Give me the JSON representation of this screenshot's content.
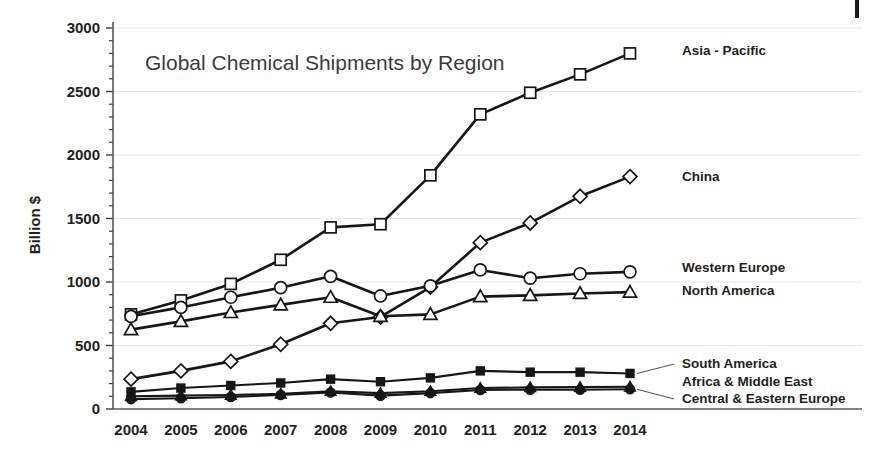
{
  "chart_data": {
    "type": "line",
    "title": "Global Chemical Shipments by Region",
    "xlabel": "",
    "ylabel": "Billion $",
    "ylim": [
      0,
      3000
    ],
    "yticks": [
      0,
      500,
      1000,
      1500,
      2000,
      2500,
      3000
    ],
    "ytick_labels": [
      "0",
      "500",
      "1000",
      "1500",
      "2000",
      "2500",
      "3000"
    ],
    "minor_tick_interval": 100,
    "grid": true,
    "grid_axis": "y",
    "legend_position": "right-inline-labels",
    "categories": [
      "2004",
      "2005",
      "2006",
      "2007",
      "2008",
      "2009",
      "2010",
      "2011",
      "2012",
      "2013",
      "2014"
    ],
    "x": [
      2004,
      2005,
      2006,
      2007,
      2008,
      2009,
      2010,
      2011,
      2012,
      2013,
      2014
    ],
    "series": [
      {
        "name": "Asia - Pacific",
        "marker": "open-square",
        "values": [
          745,
          855,
          985,
          1175,
          1430,
          1455,
          1840,
          2320,
          2490,
          2635,
          2800
        ]
      },
      {
        "name": "China",
        "marker": "open-diamond",
        "values": [
          235,
          300,
          375,
          510,
          675,
          725,
          960,
          1310,
          1465,
          1675,
          1830
        ]
      },
      {
        "name": "Western Europe",
        "marker": "open-circle",
        "values": [
          730,
          800,
          880,
          955,
          1045,
          890,
          970,
          1095,
          1030,
          1065,
          1080
        ]
      },
      {
        "name": "North America",
        "marker": "open-triangle",
        "values": [
          625,
          690,
          760,
          820,
          880,
          730,
          745,
          885,
          895,
          910,
          920
        ]
      },
      {
        "name": "South America",
        "marker": "filled-square",
        "values": [
          135,
          165,
          185,
          205,
          235,
          215,
          245,
          300,
          290,
          290,
          280
        ]
      },
      {
        "name": "Africa & Middle East",
        "marker": "filled-triangle",
        "values": [
          100,
          105,
          110,
          120,
          140,
          125,
          140,
          165,
          170,
          172,
          175
        ]
      },
      {
        "name": "Central & Eastern Europe",
        "marker": "filled-circle",
        "values": [
          78,
          85,
          95,
          110,
          130,
          105,
          125,
          150,
          152,
          152,
          155
        ]
      }
    ]
  },
  "axis": {
    "y_label": "Billion $",
    "y_ticks": [
      "3000",
      "2500",
      "2000",
      "1500",
      "1000",
      "500",
      "0"
    ],
    "x_ticks": [
      "2004",
      "2005",
      "2006",
      "2007",
      "2008",
      "2009",
      "2010",
      "2011",
      "2012",
      "2013",
      "2014"
    ]
  },
  "title": {
    "text": "Global Chemical Shipments by Region"
  },
  "legend": {
    "items": [
      {
        "label": "Asia - Pacific",
        "marker": "open-square"
      },
      {
        "label": "China",
        "marker": "open-diamond"
      },
      {
        "label": "Western Europe",
        "marker": "open-circle"
      },
      {
        "label": "North America",
        "marker": "open-triangle"
      },
      {
        "label": "South America",
        "marker": "filled-square"
      },
      {
        "label": "Africa & Middle East",
        "marker": "filled-triangle"
      },
      {
        "label": "Central & Eastern Europe",
        "marker": "filled-circle"
      }
    ]
  },
  "colors": {
    "ink": "#161616",
    "axis": "#595959",
    "grid": "#e8e8e8",
    "title": "#3b3b3b",
    "background": "#ffffff"
  }
}
